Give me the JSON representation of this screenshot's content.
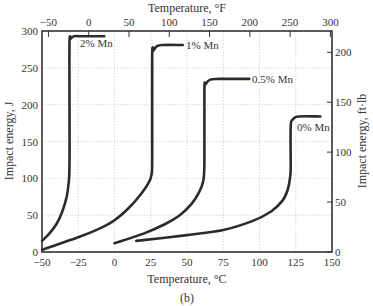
{
  "chart_data": {
    "type": "line",
    "title": "",
    "caption": "(b)",
    "xlabel": "Temperature, °C",
    "x2label": "Temperature, °F",
    "ylabel": "Impact energy, J",
    "y2label": "Impact energy, ft·lb",
    "xlim": [
      -50,
      150
    ],
    "ylim": [
      0,
      300
    ],
    "x2lim_F": [
      -58,
      302
    ],
    "y2lim_ftlb": [
      0,
      221
    ],
    "grid": true,
    "x_ticks": [
      "−50",
      "−25",
      "0",
      "25",
      "50",
      "75",
      "100",
      "125",
      "150"
    ],
    "x2_ticks": [
      "−50",
      "0",
      "50",
      "100",
      "150",
      "200",
      "250",
      "300"
    ],
    "y_ticks": [
      "0",
      "50",
      "100",
      "150",
      "200",
      "250",
      "300"
    ],
    "y2_ticks": [
      "0",
      "50",
      "100",
      "150",
      "200"
    ],
    "series": [
      {
        "name": "2% Mn",
        "x": [
          -50,
          -45,
          -40,
          -36,
          -33,
          -31.5,
          -31,
          -31,
          -31,
          -30,
          -28,
          -24,
          -7
        ],
        "y": [
          15,
          25,
          38,
          55,
          75,
          95,
          120,
          200,
          285,
          290,
          293,
          293,
          293
        ]
      },
      {
        "name": "1% Mn",
        "x": [
          -50,
          -25,
          -10,
          0,
          10,
          18,
          23,
          25.5,
          26,
          26,
          27,
          29,
          33,
          47
        ],
        "y": [
          3,
          20,
          32,
          43,
          60,
          78,
          92,
          105,
          130,
          265,
          274,
          279,
          281,
          281
        ]
      },
      {
        "name": "0.5% Mn",
        "x": [
          0,
          20,
          35,
          45,
          53,
          58,
          61,
          62,
          62,
          63,
          66,
          72,
          93
        ],
        "y": [
          12,
          25,
          38,
          50,
          65,
          80,
          95,
          120,
          220,
          228,
          234,
          235,
          235
        ]
      },
      {
        "name": "0% Mn",
        "x": [
          15,
          50,
          75,
          95,
          108,
          116,
          119.5,
          121,
          121.5,
          121.5,
          123,
          127,
          142
        ],
        "y": [
          15,
          23,
          30,
          42,
          55,
          70,
          85,
          100,
          115,
          170,
          180,
          184,
          184
        ]
      }
    ],
    "annotations": [
      "2% Mn",
      "1% Mn",
      "0.5% Mn",
      "0% Mn"
    ]
  }
}
